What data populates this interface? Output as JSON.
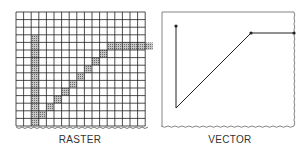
{
  "figure": {
    "raster": {
      "label": "RASTER",
      "grid": {
        "cols": 17,
        "rows": 15,
        "cell": 7.6,
        "origin": [
          16,
          12
        ]
      },
      "filled_cells": [
        [
          2,
          3
        ],
        [
          2,
          4
        ],
        [
          2,
          5
        ],
        [
          2,
          6
        ],
        [
          2,
          7
        ],
        [
          2,
          8
        ],
        [
          2,
          9
        ],
        [
          2,
          10
        ],
        [
          2,
          11
        ],
        [
          2,
          12
        ],
        [
          2,
          13
        ],
        [
          2,
          14
        ],
        [
          3,
          13
        ],
        [
          4,
          12
        ],
        [
          5,
          11
        ],
        [
          6,
          10
        ],
        [
          7,
          9
        ],
        [
          8,
          8
        ],
        [
          9,
          7
        ],
        [
          10,
          6
        ],
        [
          11,
          5
        ],
        [
          12,
          4
        ],
        [
          13,
          4
        ],
        [
          14,
          4
        ],
        [
          15,
          4
        ],
        [
          16,
          4
        ],
        [
          17,
          4
        ]
      ],
      "fill_color": "#9a9a9a",
      "line_color": "#222222"
    },
    "vector": {
      "label": "VECTOR",
      "box": {
        "x": 162,
        "y": 12,
        "w": 132,
        "h": 114
      },
      "path": [
        [
          176,
          26
        ],
        [
          176,
          108
        ],
        [
          251,
          33
        ],
        [
          294,
          33
        ]
      ],
      "line_color": "#222222"
    }
  }
}
